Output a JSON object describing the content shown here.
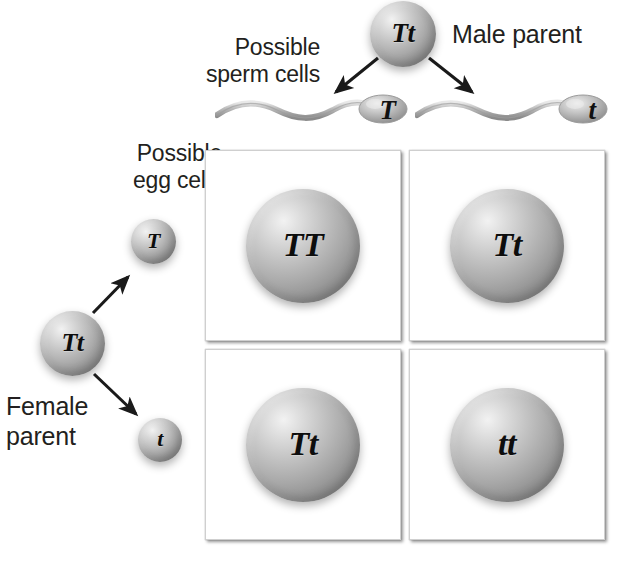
{
  "diagram": {
    "type": "punnett-square",
    "text_color": "#231f20",
    "sphere_color": "#a8a8a8",
    "background": "#ffffff"
  },
  "male": {
    "parent_label": "Male parent",
    "parent_genotype": "Tt",
    "gametes_label": "Possible\nsperm cells",
    "gametes": [
      {
        "allele": "T",
        "name": "sperm-cell-T"
      },
      {
        "allele": "t",
        "name": "sperm-cell-t"
      }
    ]
  },
  "female": {
    "parent_label": "Female\nparent",
    "parent_genotype": "Tt",
    "gametes_label": "Possible\negg cells",
    "gametes": [
      {
        "allele": "T",
        "name": "egg-cell-T"
      },
      {
        "allele": "t",
        "name": "egg-cell-t"
      }
    ]
  },
  "punnett": {
    "columns": [
      "T",
      "t"
    ],
    "rows": [
      "T",
      "t"
    ],
    "cells": [
      {
        "id": "cell-tt-dom",
        "genotype": "TT",
        "row": "T",
        "column": "T"
      },
      {
        "id": "cell-tt-het-1",
        "genotype": "Tt",
        "row": "T",
        "column": "t"
      },
      {
        "id": "cell-tt-het-2",
        "genotype": "Tt",
        "row": "t",
        "column": "T"
      },
      {
        "id": "cell-tt-rec",
        "genotype": "tt",
        "row": "t",
        "column": "t"
      }
    ]
  }
}
